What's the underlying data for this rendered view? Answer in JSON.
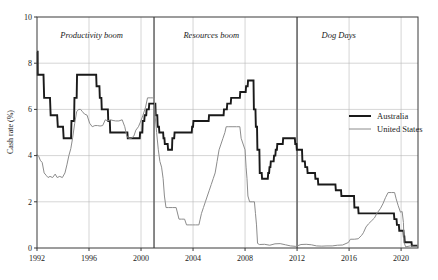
{
  "chart_data": {
    "type": "line",
    "title": "",
    "xlabel": "",
    "ylabel": "Cash rate (%)",
    "xlim": [
      1992.0,
      2021.3
    ],
    "ylim": [
      0,
      10
    ],
    "yticks": [
      0,
      2,
      4,
      6,
      8,
      10
    ],
    "ytick_labels": [
      "0",
      "2",
      "4",
      "6",
      "8",
      "10"
    ],
    "xticks": [
      1992,
      1996,
      2000,
      2004,
      2008,
      2012,
      2016,
      2020
    ],
    "xtick_labels": [
      "1992",
      "1996",
      "2000",
      "2004",
      "2008",
      "2012",
      "2016",
      "2020"
    ],
    "grid": true,
    "legend_position": "right-middle",
    "colors": {
      "australia": "#1a1a1a",
      "united_states": "#8c8c8c",
      "grid": "#b9b9b9",
      "frame": "#3a3a3a",
      "divider": "#6a6a6a",
      "background": "#ffffff"
    },
    "annotations": [
      {
        "name": "era-label-productivity-boom",
        "text": "Productivity boom",
        "x": 1996.2,
        "y": 9.1
      },
      {
        "name": "era-label-resources-boom",
        "text": "Resources boom",
        "x": 2005.4,
        "y": 9.1
      },
      {
        "name": "era-label-dog-days",
        "text": "Dog Days",
        "x": 2015.2,
        "y": 9.1
      }
    ],
    "dividers": [
      {
        "name": "divider-2001",
        "x": 2001.0
      },
      {
        "name": "divider-2012",
        "x": 2012.0
      }
    ],
    "series": [
      {
        "name": "Australia",
        "color": "#1a1a1a",
        "width": 1.9,
        "points": [
          [
            1992.0,
            8.5
          ],
          [
            1992.05,
            8.5
          ],
          [
            1992.06,
            7.5
          ],
          [
            1992.5,
            7.5
          ],
          [
            1992.55,
            6.5
          ],
          [
            1993.0,
            6.5
          ],
          [
            1993.05,
            5.75
          ],
          [
            1993.55,
            5.75
          ],
          [
            1993.6,
            5.25
          ],
          [
            1994.0,
            5.25
          ],
          [
            1994.05,
            4.75
          ],
          [
            1994.62,
            4.75
          ],
          [
            1994.65,
            5.5
          ],
          [
            1994.85,
            5.5
          ],
          [
            1994.88,
            6.5
          ],
          [
            1995.05,
            6.5
          ],
          [
            1995.08,
            7.5
          ],
          [
            1996.55,
            7.5
          ],
          [
            1996.58,
            7.0
          ],
          [
            1996.8,
            7.0
          ],
          [
            1996.83,
            6.5
          ],
          [
            1996.95,
            6.5
          ],
          [
            1996.98,
            6.0
          ],
          [
            1997.45,
            6.0
          ],
          [
            1997.48,
            5.5
          ],
          [
            1997.6,
            5.5
          ],
          [
            1997.63,
            5.0
          ],
          [
            1998.95,
            5.0
          ],
          [
            1998.98,
            4.75
          ],
          [
            1999.9,
            4.75
          ],
          [
            1999.93,
            5.0
          ],
          [
            2000.1,
            5.0
          ],
          [
            2000.13,
            5.5
          ],
          [
            2000.25,
            5.5
          ],
          [
            2000.28,
            5.75
          ],
          [
            2000.4,
            5.75
          ],
          [
            2000.43,
            6.0
          ],
          [
            2000.6,
            6.0
          ],
          [
            2000.63,
            6.25
          ],
          [
            2001.1,
            6.25
          ],
          [
            2001.13,
            5.75
          ],
          [
            2001.25,
            5.75
          ],
          [
            2001.28,
            5.25
          ],
          [
            2001.38,
            5.25
          ],
          [
            2001.41,
            5.0
          ],
          [
            2001.7,
            5.0
          ],
          [
            2001.73,
            4.75
          ],
          [
            2001.8,
            4.75
          ],
          [
            2001.83,
            4.5
          ],
          [
            2002.05,
            4.5
          ],
          [
            2002.08,
            4.25
          ],
          [
            2002.38,
            4.25
          ],
          [
            2002.41,
            4.75
          ],
          [
            2002.55,
            4.75
          ],
          [
            2002.58,
            5.0
          ],
          [
            2003.9,
            5.0
          ],
          [
            2003.93,
            5.25
          ],
          [
            2004.0,
            5.25
          ],
          [
            2004.03,
            5.5
          ],
          [
            2005.2,
            5.5
          ],
          [
            2005.23,
            5.75
          ],
          [
            2006.35,
            5.75
          ],
          [
            2006.38,
            6.0
          ],
          [
            2006.6,
            6.0
          ],
          [
            2006.63,
            6.25
          ],
          [
            2006.9,
            6.25
          ],
          [
            2006.93,
            6.5
          ],
          [
            2007.6,
            6.5
          ],
          [
            2007.63,
            6.75
          ],
          [
            2008.05,
            6.75
          ],
          [
            2008.08,
            7.0
          ],
          [
            2008.2,
            7.0
          ],
          [
            2008.23,
            7.25
          ],
          [
            2008.65,
            7.25
          ],
          [
            2008.68,
            6.0
          ],
          [
            2008.8,
            6.0
          ],
          [
            2008.83,
            5.25
          ],
          [
            2008.92,
            5.25
          ],
          [
            2008.95,
            4.25
          ],
          [
            2009.1,
            4.25
          ],
          [
            2009.13,
            3.25
          ],
          [
            2009.28,
            3.25
          ],
          [
            2009.31,
            3.0
          ],
          [
            2009.75,
            3.0
          ],
          [
            2009.78,
            3.25
          ],
          [
            2009.85,
            3.25
          ],
          [
            2009.88,
            3.5
          ],
          [
            2009.95,
            3.5
          ],
          [
            2009.98,
            3.75
          ],
          [
            2010.2,
            3.75
          ],
          [
            2010.23,
            4.0
          ],
          [
            2010.33,
            4.0
          ],
          [
            2010.36,
            4.25
          ],
          [
            2010.45,
            4.25
          ],
          [
            2010.48,
            4.5
          ],
          [
            2010.9,
            4.5
          ],
          [
            2010.93,
            4.75
          ],
          [
            2011.83,
            4.75
          ],
          [
            2011.86,
            4.5
          ],
          [
            2011.95,
            4.5
          ],
          [
            2011.98,
            4.25
          ],
          [
            2012.38,
            4.25
          ],
          [
            2012.41,
            3.75
          ],
          [
            2012.6,
            3.75
          ],
          [
            2012.63,
            3.5
          ],
          [
            2012.78,
            3.5
          ],
          [
            2012.81,
            3.25
          ],
          [
            2013.38,
            3.25
          ],
          [
            2013.41,
            3.0
          ],
          [
            2013.6,
            3.0
          ],
          [
            2013.63,
            2.75
          ],
          [
            2014.95,
            2.75
          ],
          [
            2014.98,
            2.5
          ],
          [
            2015.38,
            2.5
          ],
          [
            2015.41,
            2.25
          ],
          [
            2016.38,
            2.25
          ],
          [
            2016.41,
            1.75
          ],
          [
            2016.7,
            1.75
          ],
          [
            2016.73,
            1.5
          ],
          [
            2019.45,
            1.5
          ],
          [
            2019.48,
            1.25
          ],
          [
            2019.65,
            1.25
          ],
          [
            2019.68,
            1.0
          ],
          [
            2019.83,
            1.0
          ],
          [
            2019.86,
            0.75
          ],
          [
            2020.18,
            0.75
          ],
          [
            2020.21,
            0.5
          ],
          [
            2020.25,
            0.5
          ],
          [
            2020.28,
            0.25
          ],
          [
            2020.8,
            0.25
          ],
          [
            2020.83,
            0.1
          ],
          [
            2021.25,
            0.1
          ]
        ]
      },
      {
        "name": "United States",
        "color": "#8c8c8c",
        "width": 1.0,
        "points": [
          [
            1992.0,
            4.05
          ],
          [
            1992.15,
            3.95
          ],
          [
            1992.25,
            3.8
          ],
          [
            1992.4,
            3.7
          ],
          [
            1992.55,
            3.25
          ],
          [
            1992.7,
            3.15
          ],
          [
            1992.85,
            3.05
          ],
          [
            1993.0,
            3.1
          ],
          [
            1993.2,
            3.05
          ],
          [
            1993.4,
            3.2
          ],
          [
            1993.55,
            3.05
          ],
          [
            1993.75,
            3.1
          ],
          [
            1993.95,
            3.05
          ],
          [
            1994.15,
            3.25
          ],
          [
            1994.3,
            3.6
          ],
          [
            1994.45,
            4.0
          ],
          [
            1994.6,
            4.3
          ],
          [
            1994.75,
            4.8
          ],
          [
            1994.9,
            5.4
          ],
          [
            1995.05,
            5.9
          ],
          [
            1995.2,
            6.0
          ],
          [
            1995.35,
            6.0
          ],
          [
            1995.5,
            5.9
          ],
          [
            1995.65,
            5.8
          ],
          [
            1995.85,
            5.75
          ],
          [
            1996.05,
            5.4
          ],
          [
            1996.25,
            5.25
          ],
          [
            1996.45,
            5.3
          ],
          [
            1996.65,
            5.3
          ],
          [
            1996.85,
            5.28
          ],
          [
            1997.05,
            5.3
          ],
          [
            1997.25,
            5.55
          ],
          [
            1997.45,
            5.5
          ],
          [
            1997.65,
            5.55
          ],
          [
            1997.85,
            5.52
          ],
          [
            1998.05,
            5.5
          ],
          [
            1998.3,
            5.5
          ],
          [
            1998.55,
            5.55
          ],
          [
            1998.75,
            5.25
          ],
          [
            1998.9,
            4.85
          ],
          [
            1999.05,
            4.75
          ],
          [
            1999.25,
            4.75
          ],
          [
            1999.45,
            4.85
          ],
          [
            1999.6,
            5.1
          ],
          [
            1999.8,
            5.25
          ],
          [
            1999.95,
            5.45
          ],
          [
            2000.15,
            5.75
          ],
          [
            2000.35,
            6.1
          ],
          [
            2000.5,
            6.5
          ],
          [
            2000.7,
            6.5
          ],
          [
            2000.9,
            6.5
          ],
          [
            2001.02,
            6.5
          ],
          [
            2001.08,
            5.75
          ],
          [
            2001.2,
            5.0
          ],
          [
            2001.33,
            4.25
          ],
          [
            2001.45,
            3.75
          ],
          [
            2001.58,
            3.5
          ],
          [
            2001.7,
            3.0
          ],
          [
            2001.8,
            2.25
          ],
          [
            2001.92,
            1.75
          ],
          [
            2002.1,
            1.75
          ],
          [
            2002.4,
            1.75
          ],
          [
            2002.7,
            1.75
          ],
          [
            2002.92,
            1.25
          ],
          [
            2003.1,
            1.25
          ],
          [
            2003.35,
            1.25
          ],
          [
            2003.5,
            1.0
          ],
          [
            2003.7,
            1.0
          ],
          [
            2003.95,
            1.0
          ],
          [
            2004.2,
            1.0
          ],
          [
            2004.45,
            1.0
          ],
          [
            2004.55,
            1.25
          ],
          [
            2004.65,
            1.5
          ],
          [
            2004.8,
            1.75
          ],
          [
            2004.95,
            2.0
          ],
          [
            2005.1,
            2.25
          ],
          [
            2005.25,
            2.5
          ],
          [
            2005.4,
            2.75
          ],
          [
            2005.55,
            3.0
          ],
          [
            2005.7,
            3.25
          ],
          [
            2005.85,
            3.75
          ],
          [
            2006.0,
            4.25
          ],
          [
            2006.15,
            4.5
          ],
          [
            2006.3,
            4.75
          ],
          [
            2006.45,
            5.0
          ],
          [
            2006.55,
            5.25
          ],
          [
            2006.75,
            5.25
          ],
          [
            2007.0,
            5.25
          ],
          [
            2007.35,
            5.25
          ],
          [
            2007.6,
            5.25
          ],
          [
            2007.7,
            4.75
          ],
          [
            2007.85,
            4.5
          ],
          [
            2008.0,
            4.25
          ],
          [
            2008.08,
            3.5
          ],
          [
            2008.15,
            3.0
          ],
          [
            2008.22,
            2.25
          ],
          [
            2008.35,
            2.0
          ],
          [
            2008.55,
            2.0
          ],
          [
            2008.72,
            2.0
          ],
          [
            2008.8,
            1.5
          ],
          [
            2008.88,
            1.0
          ],
          [
            2008.96,
            0.2
          ],
          [
            2009.1,
            0.15
          ],
          [
            2009.5,
            0.16
          ],
          [
            2009.9,
            0.12
          ],
          [
            2010.3,
            0.18
          ],
          [
            2010.7,
            0.19
          ],
          [
            2011.1,
            0.14
          ],
          [
            2011.5,
            0.09
          ],
          [
            2011.9,
            0.07
          ],
          [
            2012.3,
            0.15
          ],
          [
            2012.7,
            0.16
          ],
          [
            2013.1,
            0.14
          ],
          [
            2013.5,
            0.09
          ],
          [
            2013.9,
            0.08
          ],
          [
            2014.3,
            0.09
          ],
          [
            2014.7,
            0.09
          ],
          [
            2015.1,
            0.12
          ],
          [
            2015.5,
            0.13
          ],
          [
            2015.95,
            0.24
          ],
          [
            2016.1,
            0.38
          ],
          [
            2016.4,
            0.38
          ],
          [
            2016.7,
            0.4
          ],
          [
            2016.97,
            0.55
          ],
          [
            2017.1,
            0.66
          ],
          [
            2017.3,
            0.91
          ],
          [
            2017.5,
            1.05
          ],
          [
            2017.7,
            1.16
          ],
          [
            2017.95,
            1.3
          ],
          [
            2018.15,
            1.51
          ],
          [
            2018.4,
            1.7
          ],
          [
            2018.6,
            1.91
          ],
          [
            2018.8,
            2.18
          ],
          [
            2019.0,
            2.4
          ],
          [
            2019.25,
            2.4
          ],
          [
            2019.5,
            2.4
          ],
          [
            2019.62,
            2.13
          ],
          [
            2019.78,
            1.83
          ],
          [
            2019.95,
            1.55
          ],
          [
            2020.08,
            1.58
          ],
          [
            2020.18,
            1.1
          ],
          [
            2020.22,
            0.25
          ],
          [
            2020.35,
            0.05
          ],
          [
            2020.7,
            0.09
          ],
          [
            2021.0,
            0.07
          ],
          [
            2021.25,
            0.07
          ]
        ]
      }
    ],
    "legend": [
      {
        "label": "Australia",
        "color": "#1a1a1a",
        "width": 2.0
      },
      {
        "label": "United States",
        "color": "#8c8c8c",
        "width": 1.0
      }
    ]
  }
}
